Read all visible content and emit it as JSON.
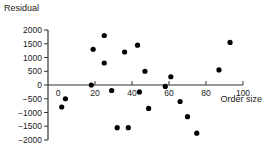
{
  "chart_data": {
    "type": "scatter",
    "title": "",
    "xlabel": "Order size",
    "ylabel": "Residual",
    "xlim": [
      0,
      100
    ],
    "ylim": [
      -2000,
      2000
    ],
    "xticks": [
      0,
      20,
      40,
      60,
      80,
      100
    ],
    "yticks": [
      2000,
      1500,
      1000,
      500,
      0,
      -500,
      -1000,
      -1500,
      -2000
    ],
    "grid": false,
    "legend": null,
    "marker_color": "#000000",
    "points": [
      {
        "x": 2,
        "y": -800
      },
      {
        "x": 4,
        "y": -500
      },
      {
        "x": 18,
        "y": 0
      },
      {
        "x": 19,
        "y": 1300
      },
      {
        "x": 25,
        "y": 1800
      },
      {
        "x": 25,
        "y": 800
      },
      {
        "x": 29,
        "y": -200
      },
      {
        "x": 32,
        "y": -1550
      },
      {
        "x": 36,
        "y": 1200
      },
      {
        "x": 38,
        "y": -1550
      },
      {
        "x": 43,
        "y": 1450
      },
      {
        "x": 44,
        "y": -250
      },
      {
        "x": 47,
        "y": 500
      },
      {
        "x": 49,
        "y": -850
      },
      {
        "x": 58,
        "y": -50
      },
      {
        "x": 61,
        "y": 300
      },
      {
        "x": 66,
        "y": -600
      },
      {
        "x": 70,
        "y": -1150
      },
      {
        "x": 75,
        "y": -1750
      },
      {
        "x": 87,
        "y": 550
      },
      {
        "x": 93,
        "y": 1550
      }
    ]
  }
}
